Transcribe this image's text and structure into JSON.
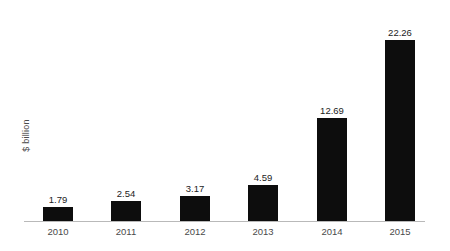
{
  "chart_data": {
    "type": "bar",
    "title": "",
    "subtitle": "",
    "xlabel": "",
    "ylabel": "$ billion",
    "categories": [
      "2010",
      "2011",
      "2012",
      "2013",
      "2014",
      "2015"
    ],
    "values": [
      1.79,
      2.54,
      3.17,
      4.59,
      12.69,
      22.26
    ],
    "value_labels": [
      "1.79",
      "2.54",
      "3.17",
      "4.59",
      "12.69",
      "22.26"
    ],
    "ylim": [
      0,
      24.5
    ],
    "grid": false,
    "legend": null,
    "legend_position": "none",
    "annotations": [],
    "series": [
      {
        "name": "",
        "values": [
          1.79,
          2.54,
          3.17,
          4.59,
          12.69,
          22.26
        ]
      }
    ],
    "colors": {
      "bar": "#0d0d0d",
      "axis_line": "#b9b9b9",
      "tick_label": "#4a4a4a",
      "value_label": "#1c1c1c",
      "axis_title": "#4a4a4a",
      "background": "#ffffff"
    }
  }
}
